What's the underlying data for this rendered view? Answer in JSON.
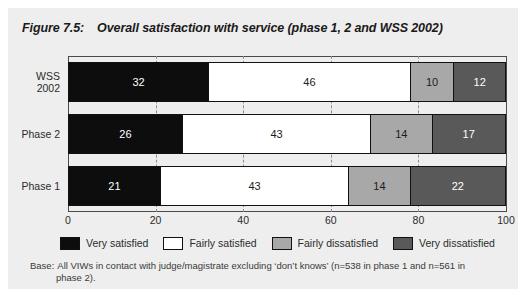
{
  "figure": {
    "number": "Figure 7.5:",
    "title": "Overall satisfaction with service (phase 1, 2 and WSS 2002)",
    "background_color": "#eeeeee"
  },
  "footnote": {
    "label": "Base:",
    "line1": "All VIWs in contact with judge/magistrate excluding ‘don’t knows’ (n=538 in phase 1 and n=561 in",
    "line2": "phase 2)."
  },
  "chart_data": {
    "type": "bar",
    "orientation": "horizontal",
    "stacked": true,
    "stack_total": 100,
    "title": "Overall satisfaction with service (phase 1, 2 and WSS 2002)",
    "xlabel": "",
    "ylabel": "",
    "xlim": [
      0,
      100
    ],
    "xticks": [
      "0",
      "20",
      "40",
      "60",
      "80",
      "100"
    ],
    "xtick_values": [
      0,
      20,
      40,
      60,
      80,
      100
    ],
    "grid": "vertical dashed at 20, 40, 60, 80",
    "legend_position": "bottom",
    "categories": [
      "WSS\n2002",
      "Phase 2",
      "Phase 1"
    ],
    "series": [
      {
        "name": "Very satisfied",
        "color": "#0d0d0d",
        "values": [
          32,
          26,
          21
        ]
      },
      {
        "name": "Fairly satisfied",
        "color": "#ffffff",
        "values": [
          46,
          43,
          43
        ]
      },
      {
        "name": "Fairly dissatisfied",
        "color": "#a8a8a8",
        "values": [
          10,
          14,
          14
        ]
      },
      {
        "name": "Very dissatisfied",
        "color": "#595959",
        "values": [
          12,
          17,
          22
        ]
      }
    ],
    "rows": [
      {
        "label": "WSS\n2002",
        "segments": [
          {
            "series": "Very satisfied",
            "value": 32,
            "label": "32",
            "color": "#0d0d0d"
          },
          {
            "series": "Fairly satisfied",
            "value": 46,
            "label": "46",
            "color": "#ffffff"
          },
          {
            "series": "Fairly dissatisfied",
            "value": 10,
            "label": "10",
            "color": "#a8a8a8"
          },
          {
            "series": "Very dissatisfied",
            "value": 12,
            "label": "12",
            "color": "#595959"
          }
        ]
      },
      {
        "label": "Phase 2",
        "segments": [
          {
            "series": "Very satisfied",
            "value": 26,
            "label": "26",
            "color": "#0d0d0d"
          },
          {
            "series": "Fairly satisfied",
            "value": 43,
            "label": "43",
            "color": "#ffffff"
          },
          {
            "series": "Fairly dissatisfied",
            "value": 14,
            "label": "14",
            "color": "#a8a8a8"
          },
          {
            "series": "Very dissatisfied",
            "value": 17,
            "label": "17",
            "color": "#595959"
          }
        ]
      },
      {
        "label": "Phase 1",
        "segments": [
          {
            "series": "Very satisfied",
            "value": 21,
            "label": "21",
            "color": "#0d0d0d"
          },
          {
            "series": "Fairly satisfied",
            "value": 43,
            "label": "43",
            "color": "#ffffff"
          },
          {
            "series": "Fairly dissatisfied",
            "value": 14,
            "label": "14",
            "color": "#a8a8a8"
          },
          {
            "series": "Very dissatisfied",
            "value": 22,
            "label": "22",
            "color": "#595959"
          }
        ]
      }
    ],
    "legend": [
      {
        "label": "Very satisfied",
        "color": "#0d0d0d"
      },
      {
        "label": "Fairly satisfied",
        "color": "#ffffff"
      },
      {
        "label": "Fairly dissatisfied",
        "color": "#a8a8a8"
      },
      {
        "label": "Very dissatisfied",
        "color": "#595959"
      }
    ]
  }
}
